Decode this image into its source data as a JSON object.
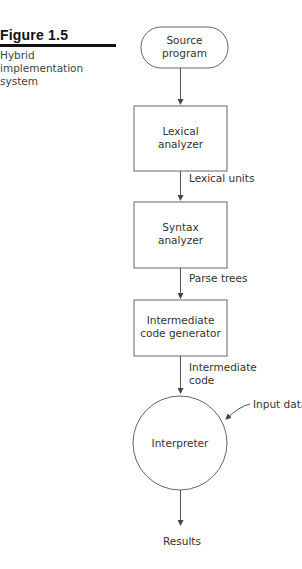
{
  "figure": {
    "label": "Figure 1.5",
    "caption": "Hybrid implementation system"
  },
  "nodes": {
    "source": {
      "line1": "Source",
      "line2": "program",
      "shape": "stadium"
    },
    "lexical": {
      "line1": "Lexical",
      "line2": "analyzer",
      "shape": "rectangle"
    },
    "syntax": {
      "line1": "Syntax",
      "line2": "analyzer",
      "shape": "rectangle"
    },
    "intermediate": {
      "line1": "Intermediate",
      "line2": "code generator",
      "shape": "rectangle"
    },
    "interpreter": {
      "label": "Interpreter",
      "shape": "circle"
    }
  },
  "edges": {
    "lexical_units": "Lexical units",
    "parse_trees": "Parse trees",
    "intermediate_code_line1": "Intermediate",
    "intermediate_code_line2": "code",
    "input_data": "Input data",
    "results": "Results"
  },
  "colors": {
    "line": "#555555",
    "text": "#333333",
    "heading": "#111111"
  }
}
